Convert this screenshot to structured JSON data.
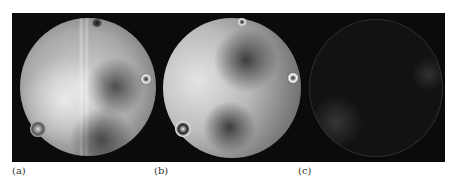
{
  "figure": {
    "panels": [
      {
        "id": "a",
        "label": "(a)",
        "description": "interferogram with vertical fringes and three singularities"
      },
      {
        "id": "b",
        "label": "(b)",
        "description": "interferogram with three optical vortices"
      },
      {
        "id": "c",
        "label": "(c)",
        "description": "difference image, mostly dark"
      }
    ]
  }
}
